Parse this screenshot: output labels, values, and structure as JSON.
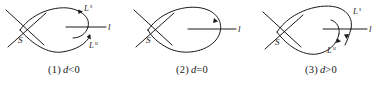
{
  "figure": {
    "background_color": "#ffffff",
    "stroke_color": "#1a1a1a",
    "panels": [
      {
        "id": "panel-1",
        "index_label": "(1)",
        "param_symbol": "d",
        "relation": "<0",
        "caption": "(1) d<0",
        "saddle_label": "S",
        "line_label": "l",
        "manifold_labels": [
          {
            "base": "L",
            "sup": "s",
            "position": "upper-right"
          },
          {
            "base": "L",
            "sup": "u",
            "position": "lower-right"
          }
        ],
        "description": "Separatrices miss each other; both ends stop short of line l"
      },
      {
        "id": "panel-2",
        "index_label": "(2)",
        "param_symbol": "d",
        "relation": "=0",
        "caption": "(2) d=0",
        "saddle_label": "S",
        "line_label": "l",
        "manifold_labels": [],
        "description": "Separatrices coincide forming a closed homoclinic loop through line l"
      },
      {
        "id": "panel-3",
        "index_label": "(3)",
        "param_symbol": "d",
        "relation": ">0",
        "caption": "(3) d>0",
        "saddle_label": "S",
        "line_label": "l",
        "manifold_labels": [
          {
            "base": "L",
            "sup": "s",
            "position": "upper-right"
          },
          {
            "base": "L",
            "sup": "u",
            "position": "lower-right"
          }
        ],
        "description": "Separatrices cross over line l in the opposite order"
      }
    ]
  }
}
